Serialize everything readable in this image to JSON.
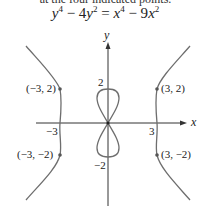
{
  "header": {
    "cut_text": "at the four indicated points.",
    "equation": {
      "y_term": "y",
      "y_pow": "4",
      "minus1": "− 4",
      "y2": "y",
      "y2_pow": "2",
      "eq": "=",
      "x_term": "x",
      "x_pow": "4",
      "minus2": "− 9",
      "x2": "x",
      "x2_pow": "2"
    }
  },
  "axes": {
    "x_label": "x",
    "y_label": "y"
  },
  "ticks": {
    "x_neg": "−3",
    "x_pos": "3",
    "y_pos": "2",
    "y_neg": "−2"
  },
  "points": [
    {
      "label": "(−3, 2)"
    },
    {
      "label": "(3, 2)"
    },
    {
      "label": "(−3, −2)"
    },
    {
      "label": "(3, −2)"
    }
  ],
  "colors": {
    "curve": "#6e6e6e",
    "axis": "#333333"
  }
}
